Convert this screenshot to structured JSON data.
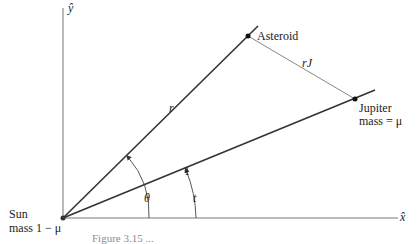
{
  "axes": {
    "y_label": "ŷ",
    "x_label": "x̂"
  },
  "bodies": {
    "asteroid": {
      "label": "Asteroid"
    },
    "jupiter": {
      "label_line1": "Jupiter",
      "label_line2": "mass = μ"
    },
    "sun": {
      "label_line1": "Sun",
      "label_line2": "mass 1 − μ"
    }
  },
  "segments": {
    "sun_asteroid": "r",
    "sun_jupiter": "1",
    "asteroid_jupiter": "rJ"
  },
  "angles": {
    "asteroid_angle": "θ",
    "jupiter_angle": "t"
  },
  "caption": "Figure 3.15  ..."
}
